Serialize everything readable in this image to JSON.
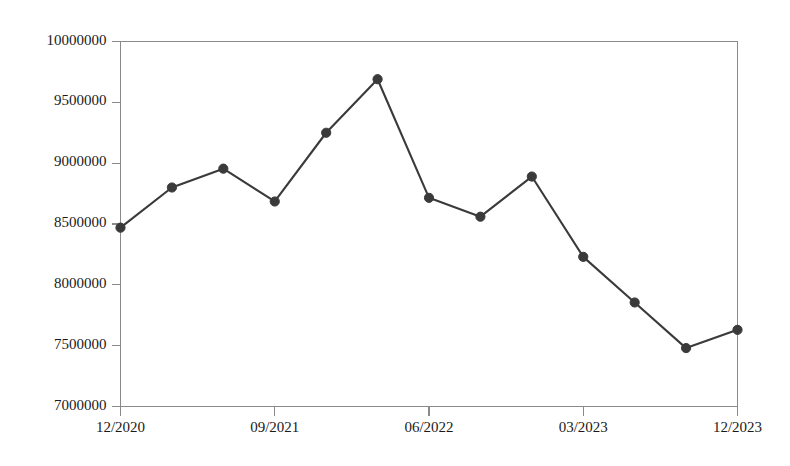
{
  "chart_data": {
    "type": "line",
    "title": "",
    "subtitle": "",
    "xlabel": "",
    "ylabel": "",
    "x": [
      "12/2020",
      "03/2021",
      "06/2021",
      "09/2021",
      "12/2021",
      "03/2022",
      "06/2022",
      "09/2022",
      "12/2022",
      "03/2023",
      "06/2023",
      "09/2023",
      "12/2023"
    ],
    "values": [
      8470000,
      8800000,
      8955000,
      8685000,
      9250000,
      9690000,
      8715000,
      8560000,
      8890000,
      8230000,
      7855000,
      7480000,
      7630000
    ],
    "series": [
      {
        "name": "",
        "values": [
          8470000,
          8800000,
          8955000,
          8685000,
          9250000,
          9690000,
          8715000,
          8560000,
          8890000,
          8230000,
          7855000,
          7480000,
          7630000
        ]
      }
    ],
    "ylim": [
      7000000,
      10000000
    ],
    "ytick_labels": [
      "10000000",
      "9500000",
      "9000000",
      "8500000",
      "8000000",
      "7500000",
      "7000000"
    ],
    "ytick_values": [
      10000000,
      9500000,
      9000000,
      8500000,
      8000000,
      7500000,
      7000000
    ],
    "xtick_labels": [
      "12/2020",
      "09/2021",
      "06/2022",
      "03/2023",
      "12/2023"
    ],
    "xtick_indices": [
      0,
      3,
      6,
      9,
      12
    ],
    "grid": false,
    "legend": "none",
    "marker": "circle",
    "line_color": "#3a3a3a",
    "marker_color": "#3a3a3a",
    "axis_color": "#8a8a8a",
    "text_color": "#1a1a1a",
    "background_color": "#ffffff"
  }
}
